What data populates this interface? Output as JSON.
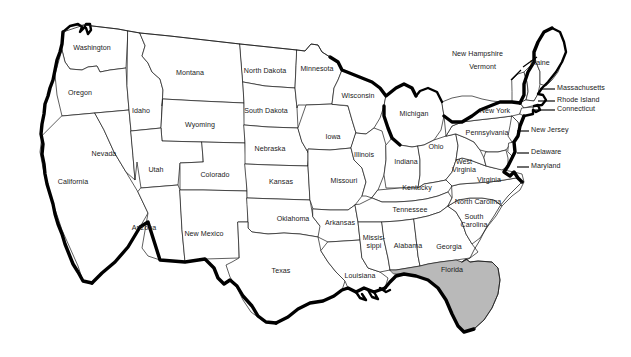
{
  "map": {
    "title": "Map of the United States",
    "highlighted_state": "Florida",
    "highlight_color": "#b9b9b9",
    "background_color": "#ffffff",
    "outline_color": "#1a1a1a",
    "coast_color": "#000000",
    "states": [
      {
        "name": "Washington",
        "x": 92,
        "y": 49,
        "multiline": false
      },
      {
        "name": "Oregon",
        "x": 80,
        "y": 94,
        "multiline": false
      },
      {
        "name": "California",
        "x": 73,
        "y": 183,
        "multiline": false
      },
      {
        "name": "Nevada",
        "x": 104,
        "y": 155,
        "multiline": false
      },
      {
        "name": "Idaho",
        "x": 141,
        "y": 112,
        "multiline": false
      },
      {
        "name": "Montana",
        "x": 190,
        "y": 74,
        "multiline": false
      },
      {
        "name": "Wyoming",
        "x": 200,
        "y": 126,
        "multiline": false
      },
      {
        "name": "Utah",
        "x": 156,
        "y": 171,
        "multiline": false
      },
      {
        "name": "Colorado",
        "x": 215,
        "y": 176,
        "multiline": false
      },
      {
        "name": "Arizona",
        "x": 144,
        "y": 229,
        "multiline": false
      },
      {
        "name": "New Mexico",
        "x": 204,
        "y": 235,
        "multiline": false
      },
      {
        "name": "North Dakota",
        "x": 265,
        "y": 72,
        "multiline": false
      },
      {
        "name": "South Dakota",
        "x": 266,
        "y": 112,
        "multiline": false
      },
      {
        "name": "Nebraska",
        "x": 270,
        "y": 150,
        "multiline": false
      },
      {
        "name": "Kansas",
        "x": 281,
        "y": 183,
        "multiline": false
      },
      {
        "name": "Oklahoma",
        "x": 293,
        "y": 220,
        "multiline": false
      },
      {
        "name": "Texas",
        "x": 281,
        "y": 272,
        "multiline": false
      },
      {
        "name": "Minnesota",
        "x": 317,
        "y": 70,
        "multiline": false
      },
      {
        "name": "Iowa",
        "x": 333,
        "y": 138,
        "multiline": false
      },
      {
        "name": "Missouri",
        "x": 344,
        "y": 182,
        "multiline": false
      },
      {
        "name": "Arkansas",
        "x": 340,
        "y": 224,
        "multiline": false
      },
      {
        "name": "Louisiana",
        "x": 360,
        "y": 277,
        "multiline": false
      },
      {
        "name": "Wisconsin",
        "x": 358,
        "y": 97,
        "multiline": false
      },
      {
        "name": "Illinois",
        "x": 364,
        "y": 156,
        "multiline": false
      },
      {
        "name": "Michigan",
        "x": 414,
        "y": 115,
        "multiline": false
      },
      {
        "name": "Indiana",
        "x": 406,
        "y": 163,
        "multiline": false
      },
      {
        "name": "Ohio",
        "x": 436,
        "y": 148,
        "multiline": false
      },
      {
        "name": "Kentucky",
        "x": 417,
        "y": 189,
        "multiline": false
      },
      {
        "name": "Tennessee",
        "x": 410,
        "y": 211,
        "multiline": false
      },
      {
        "name": "Missis-\nsippi",
        "x": 374,
        "y": 243,
        "multiline": true
      },
      {
        "name": "Alabama",
        "x": 408,
        "y": 247,
        "multiline": false
      },
      {
        "name": "Georgia",
        "x": 449,
        "y": 248,
        "multiline": false
      },
      {
        "name": "Florida",
        "x": 452,
        "y": 271,
        "multiline": false
      },
      {
        "name": "South\nCarolina",
        "x": 474,
        "y": 222,
        "multiline": true
      },
      {
        "name": "North Carolina",
        "x": 478,
        "y": 203,
        "multiline": false
      },
      {
        "name": "Virginia",
        "x": 489,
        "y": 181,
        "multiline": false
      },
      {
        "name": "West\nVirginia",
        "x": 464,
        "y": 167,
        "multiline": true
      },
      {
        "name": "Pennsylvania",
        "x": 487,
        "y": 134,
        "multiline": false
      },
      {
        "name": "New York",
        "x": 495,
        "y": 112,
        "multiline": false
      },
      {
        "name": "Maine",
        "x": 540,
        "y": 64,
        "multiline": false
      }
    ],
    "callouts": [
      {
        "name": "New Hampshire",
        "label_x": 503,
        "label_y": 55,
        "align": "right",
        "line": [
          [
            537,
            57
          ],
          [
            523,
            67
          ]
        ]
      },
      {
        "name": "Vermont",
        "label_x": 496,
        "label_y": 68,
        "align": "right",
        "line": [
          [
            521,
            70
          ],
          [
            511,
            80
          ]
        ]
      },
      {
        "name": "Massachusetts",
        "label_x": 557,
        "label_y": 89,
        "align": "left",
        "line": [
          [
            555,
            89
          ],
          [
            540,
            89
          ]
        ]
      },
      {
        "name": "Rhode Island",
        "label_x": 557,
        "label_y": 101,
        "align": "left",
        "line": [
          [
            555,
            101
          ],
          [
            538,
            101
          ]
        ]
      },
      {
        "name": "Connecticut",
        "label_x": 557,
        "label_y": 110,
        "align": "left",
        "line": [
          [
            555,
            110
          ],
          [
            533,
            110
          ]
        ]
      },
      {
        "name": "New Jersey",
        "label_x": 531,
        "label_y": 131,
        "align": "left",
        "line": [
          [
            529,
            131
          ],
          [
            517,
            131
          ]
        ]
      },
      {
        "name": "Delaware",
        "label_x": 531,
        "label_y": 153,
        "align": "left",
        "line": [
          [
            529,
            153
          ],
          [
            517,
            153
          ]
        ]
      },
      {
        "name": "Maryland",
        "label_x": 531,
        "label_y": 167,
        "align": "left",
        "line": [
          [
            529,
            167
          ],
          [
            517,
            167
          ]
        ]
      }
    ]
  }
}
